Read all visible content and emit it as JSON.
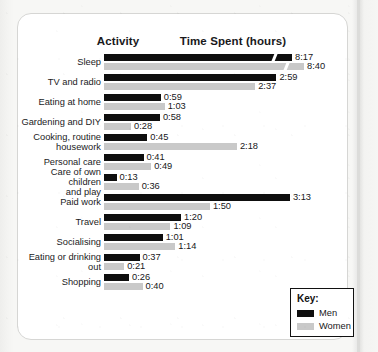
{
  "header": {
    "activity_label": "Activity",
    "time_label": "Time Spent (hours)"
  },
  "legend": {
    "title": "Key:",
    "items": [
      {
        "label": "Men",
        "color": "#0e0e0e",
        "icon": "men-swatch"
      },
      {
        "label": "Women",
        "color": "#c9c9c9",
        "icon": "women-swatch"
      }
    ]
  },
  "chart_data": {
    "type": "bar",
    "orientation": "horizontal",
    "title": "Time Spent (hours)",
    "xlabel": "Time Spent (hours)",
    "ylabel": "Activity",
    "grid": false,
    "legend_position": "bottom-right",
    "value_format": "h:mm",
    "axis_break": {
      "row": "Sleep",
      "note": "bars truncated with break marker"
    },
    "categories": [
      "Sleep",
      "TV and radio",
      "Eating at home",
      "Gardening and DIY",
      "Cooking, routine\nhousework",
      "Personal care",
      "Care of own children\nand play",
      "Paid work",
      "Travel",
      "Socialising",
      "Eating or drinking out",
      "Shopping"
    ],
    "series": [
      {
        "name": "Men",
        "color": "#0e0e0e",
        "values": [
          "8:17",
          "2:59",
          "0:59",
          "0:58",
          "0:45",
          "0:41",
          "0:13",
          "3:13",
          "1:20",
          "1:01",
          "0:37",
          "0:26"
        ],
        "minutes": [
          497,
          179,
          59,
          58,
          45,
          41,
          13,
          193,
          80,
          61,
          37,
          26
        ]
      },
      {
        "name": "Women",
        "color": "#c9c9c9",
        "values": [
          "8:40",
          "2:37",
          "1:03",
          "0:28",
          "2:18",
          "0:49",
          "0:36",
          "1:50",
          "1:09",
          "1:14",
          "0:21",
          "0:40"
        ],
        "minutes": [
          520,
          157,
          63,
          28,
          138,
          49,
          36,
          110,
          69,
          74,
          21,
          40
        ]
      }
    ]
  }
}
